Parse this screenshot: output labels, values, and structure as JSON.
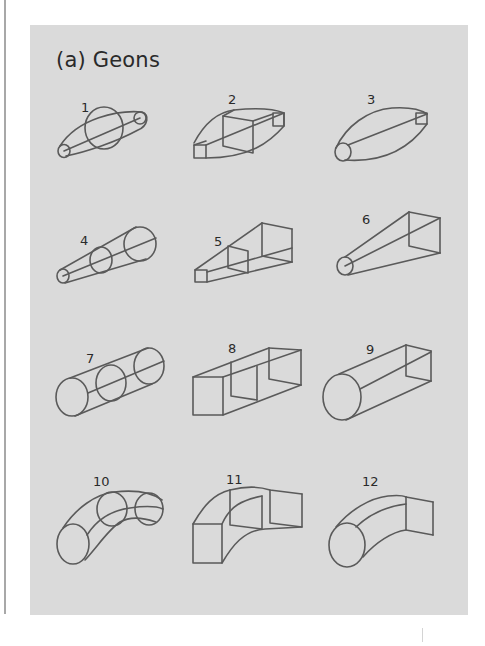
{
  "figure": {
    "title": "(a) Geons",
    "background": "#dadada",
    "stroke_color": "#5a5a5a",
    "geons": [
      {
        "id": 1,
        "label": "1",
        "description": "spindle-shaped curved cross-section with circles"
      },
      {
        "id": 2,
        "label": "2",
        "description": "spindle-shaped straight cross-section with squares"
      },
      {
        "id": 3,
        "label": "3",
        "description": "spindle with circle end and square end"
      },
      {
        "id": 4,
        "label": "4",
        "description": "expanding cone with circular cross-sections"
      },
      {
        "id": 5,
        "label": "5",
        "description": "expanding prism with square cross-sections"
      },
      {
        "id": 6,
        "label": "6",
        "description": "expanding shape, circle to square"
      },
      {
        "id": 7,
        "label": "7",
        "description": "cylinder"
      },
      {
        "id": 8,
        "label": "8",
        "description": "rectangular box"
      },
      {
        "id": 9,
        "label": "9",
        "description": "cylinder with circle end and rectangular end"
      },
      {
        "id": 10,
        "label": "10",
        "description": "curved cylinder"
      },
      {
        "id": 11,
        "label": "11",
        "description": "curved box"
      },
      {
        "id": 12,
        "label": "12",
        "description": "curved shape, circle to square"
      }
    ]
  }
}
